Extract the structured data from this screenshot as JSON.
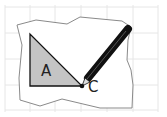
{
  "diagram": {
    "labels": {
      "triangle": "A",
      "point": "C"
    },
    "colors": {
      "grid": "#e6e6e6",
      "paper_outline": "#8a8a8a",
      "triangle_fill": "#c4c4c4",
      "triangle_stroke": "#111111",
      "pencil": "#111111"
    }
  }
}
